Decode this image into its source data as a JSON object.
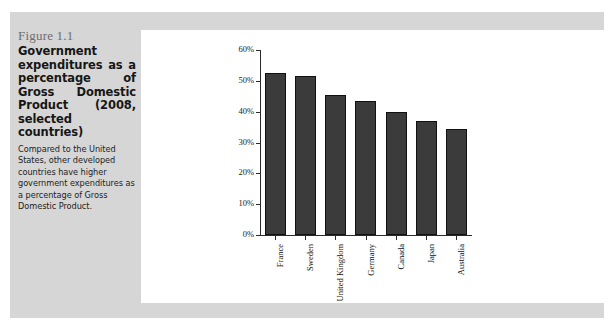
{
  "figure": {
    "number": "Figure 1.1",
    "title": "Government expenditures as a percentage of Gross Domestic Product (2008, selected countries)",
    "description": "Compared to the United States, other developed countries have higher government expenditures as a percentage of Gross Domestic Product."
  },
  "colors": {
    "bar_fill": "#3b3b3b",
    "bar_stroke": "#111111",
    "figure_background": "#d6d6d6",
    "panel_background": "#ffffff",
    "axis": "#2b2b2b",
    "figure_number_text": "#6d6d6d"
  },
  "chart_data": {
    "type": "bar",
    "title": "",
    "xlabel": "",
    "ylabel": "",
    "categories": [
      "France",
      "Sweden",
      "United Kingdom",
      "Germany",
      "Canada",
      "Japan",
      "Australia"
    ],
    "values": [
      52.5,
      51.5,
      45.5,
      43.5,
      40.0,
      37.0,
      34.5
    ],
    "value_labels": [
      "52.5%",
      "51.5%",
      "45.5%",
      "43.5%",
      "40.0%",
      "37.0%",
      "34.5%"
    ],
    "ylim": [
      0,
      60
    ],
    "ytick_values": [
      0,
      10,
      20,
      30,
      40,
      50,
      60
    ],
    "ytick_labels": [
      "0%",
      "10%",
      "20%",
      "30%",
      "40%",
      "50%",
      "60%"
    ],
    "grid": false,
    "legend": false,
    "legend_position": "none",
    "x_tick_label_rotation": -90
  }
}
